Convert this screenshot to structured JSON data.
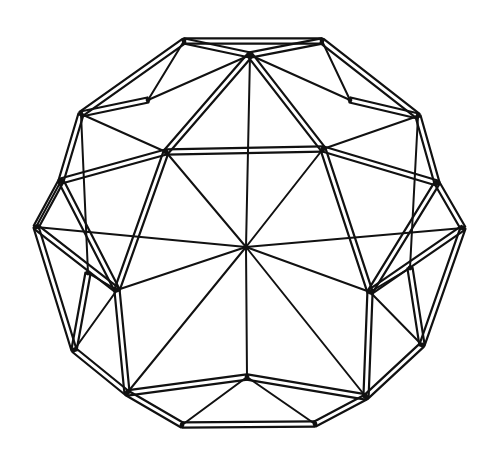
{
  "figure": {
    "title": "Polyhedral sphere line drawing",
    "colors": {
      "background": "#ffffff",
      "ink": "#111111"
    },
    "center_vertex": [
      246,
      247
    ],
    "vertices": {
      "C": [
        246,
        247
      ],
      "UL": [
        166,
        152
      ],
      "UR": [
        323,
        149
      ],
      "T": [
        250,
        55
      ],
      "TL": [
        184,
        41
      ],
      "TR": [
        322,
        41
      ],
      "L1": [
        81,
        114
      ],
      "L2": [
        61,
        181
      ],
      "L3": [
        36,
        227
      ],
      "R1": [
        418,
        116
      ],
      "R2": [
        437,
        183
      ],
      "R3": [
        463,
        228
      ],
      "ML": [
        117,
        290
      ],
      "MR": [
        370,
        292
      ],
      "BL": [
        127,
        393
      ],
      "BR": [
        366,
        397
      ],
      "B": [
        247,
        377
      ],
      "BBL": [
        182,
        425
      ],
      "BBR": [
        315,
        424
      ],
      "LL": [
        74,
        350
      ],
      "RR": [
        422,
        345
      ],
      "ITL": [
        148,
        100
      ],
      "ITR": [
        350,
        100
      ],
      "ILL": [
        88,
        273
      ],
      "IRR": [
        410,
        268
      ]
    },
    "struts": [
      [
        "TL",
        "TR"
      ],
      [
        "TL",
        "T"
      ],
      [
        "TR",
        "T"
      ],
      [
        "TL",
        "L1"
      ],
      [
        "TR",
        "R1"
      ],
      [
        "L1",
        "L2"
      ],
      [
        "L2",
        "L3"
      ],
      [
        "R1",
        "R2"
      ],
      [
        "R2",
        "R3"
      ],
      [
        "T",
        "UL"
      ],
      [
        "T",
        "UR"
      ],
      [
        "UL",
        "UR"
      ],
      [
        "L2",
        "UL"
      ],
      [
        "R2",
        "UR"
      ],
      [
        "L2",
        "ML"
      ],
      [
        "R2",
        "MR"
      ],
      [
        "L3",
        "LL"
      ],
      [
        "R3",
        "RR"
      ],
      [
        "L3",
        "ML"
      ],
      [
        "R3",
        "MR"
      ],
      [
        "ML",
        "BL"
      ],
      [
        "MR",
        "BR"
      ],
      [
        "LL",
        "BL"
      ],
      [
        "RR",
        "BR"
      ],
      [
        "BL",
        "B"
      ],
      [
        "BR",
        "B"
      ],
      [
        "BL",
        "BBL"
      ],
      [
        "BR",
        "BBR"
      ],
      [
        "BBL",
        "BBR"
      ],
      [
        "ML",
        "UL"
      ],
      [
        "MR",
        "UR"
      ],
      [
        "L1",
        "ITL"
      ],
      [
        "R1",
        "ITR"
      ],
      [
        "ILL",
        "LL"
      ],
      [
        "IRR",
        "RR"
      ]
    ],
    "edges": [
      [
        "C",
        "T"
      ],
      [
        "C",
        "UL"
      ],
      [
        "C",
        "UR"
      ],
      [
        "C",
        "ML"
      ],
      [
        "C",
        "MR"
      ],
      [
        "C",
        "B"
      ],
      [
        "C",
        "L3"
      ],
      [
        "C",
        "R3"
      ],
      [
        "C",
        "BL"
      ],
      [
        "C",
        "BR"
      ],
      [
        "UL",
        "L1"
      ],
      [
        "UR",
        "R1"
      ],
      [
        "T",
        "ITL"
      ],
      [
        "T",
        "ITR"
      ],
      [
        "TL",
        "ITL"
      ],
      [
        "TR",
        "ITR"
      ],
      [
        "L2",
        "L3"
      ],
      [
        "ML",
        "LL"
      ],
      [
        "MR",
        "RR"
      ],
      [
        "B",
        "BBL"
      ],
      [
        "B",
        "BBR"
      ],
      [
        "L1",
        "ILL"
      ],
      [
        "R1",
        "IRR"
      ],
      [
        "ILL",
        "ML"
      ],
      [
        "IRR",
        "MR"
      ]
    ]
  }
}
